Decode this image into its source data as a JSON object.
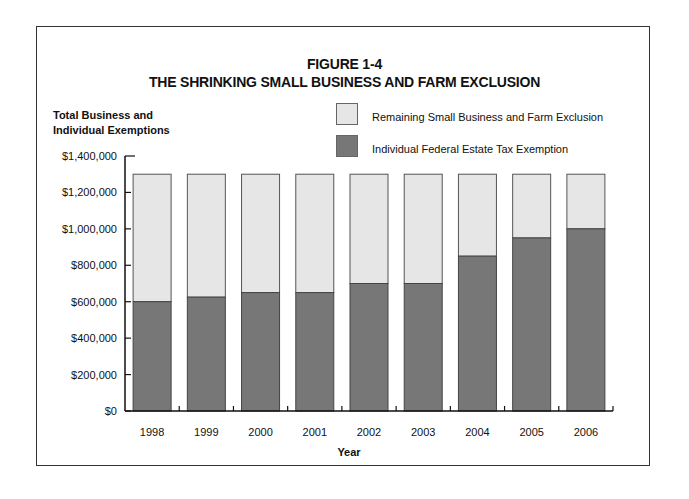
{
  "chart_data": {
    "type": "bar",
    "stacked": true,
    "title": "FIGURE 1-4",
    "subtitle": "THE SHRINKING SMALL BUSINESS AND FARM EXCLUSION",
    "xlabel": "Year",
    "ylabel": "Total Business and Individual Exemptions",
    "ylabel_lines": [
      "Total Business and",
      "Individual Exemptions"
    ],
    "ylim": [
      0,
      1400000
    ],
    "yticks": [
      0,
      200000,
      400000,
      600000,
      800000,
      1000000,
      1200000,
      1400000
    ],
    "ytick_labels": [
      "$0",
      "$200,000",
      "$400,000",
      "$600,000",
      "$800,000",
      "$1,000,000",
      "$1,200,000",
      "$1,400,000"
    ],
    "categories": [
      "1998",
      "1999",
      "2000",
      "2001",
      "2002",
      "2003",
      "2004",
      "2005",
      "2006"
    ],
    "total": 1300000,
    "series": [
      {
        "name": "Individual Federal Estate Tax Exemption",
        "color": "#777777",
        "values": [
          600000,
          625000,
          650000,
          650000,
          700000,
          700000,
          850000,
          950000,
          1000000
        ]
      },
      {
        "name": "Remaining Small Business and Farm Exclusion",
        "color": "#e6e6e6",
        "values": [
          700000,
          675000,
          650000,
          650000,
          600000,
          600000,
          450000,
          350000,
          300000
        ]
      }
    ],
    "legend_position": "top-right",
    "grid": false
  },
  "legend": {
    "items": [
      {
        "label": "Remaining Small Business and Farm Exclusion",
        "color": "#e6e6e6"
      },
      {
        "label": "Individual Federal Estate Tax Exemption",
        "color": "#777777"
      }
    ]
  }
}
